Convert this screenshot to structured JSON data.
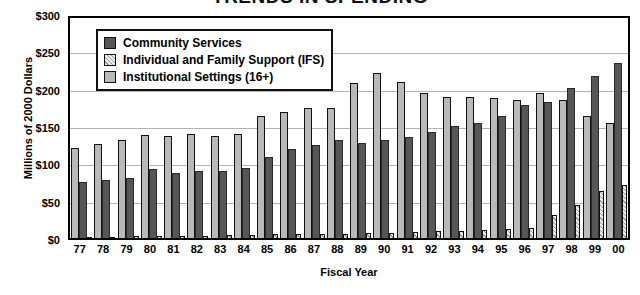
{
  "chart_data": {
    "type": "bar",
    "title": "TRENDS IN SPENDING",
    "xlabel": "Fiscal Year",
    "ylabel": "Millions of 2000 Dollars",
    "ylim": [
      0,
      300
    ],
    "ytick_labels": [
      "$300",
      "$250",
      "$200",
      "$150",
      "$100",
      "$50",
      "$0"
    ],
    "ytick_values": [
      300,
      250,
      200,
      150,
      100,
      50,
      0
    ],
    "grid": true,
    "legend_position": "upper-left-inside",
    "categories": [
      "77",
      "78",
      "79",
      "80",
      "81",
      "82",
      "83",
      "84",
      "85",
      "86",
      "87",
      "88",
      "89",
      "90",
      "91",
      "92",
      "93",
      "94",
      "95",
      "96",
      "97",
      "98",
      "99",
      "00"
    ],
    "series": [
      {
        "name": "Community Services",
        "color": "#565656",
        "values": [
          76,
          79,
          81,
          93,
          88,
          90,
          90,
          95,
          110,
          120,
          126,
          132,
          128,
          133,
          137,
          143,
          151,
          155,
          165,
          180,
          184,
          203,
          219,
          237
        ]
      },
      {
        "name": "Individual and Family Support (IFS)",
        "color": "#ececec",
        "values": [
          2,
          2,
          3,
          3,
          3,
          3,
          4,
          4,
          5,
          5,
          6,
          6,
          7,
          7,
          8,
          9,
          10,
          11,
          12,
          14,
          31,
          44,
          64,
          72
        ]
      },
      {
        "name": "Institutional Settings (16+)",
        "color": "#b9b9b9",
        "values": [
          122,
          127,
          133,
          139,
          138,
          140,
          138,
          140,
          165,
          170,
          176,
          176,
          209,
          223,
          211,
          196,
          190,
          190,
          189,
          186,
          196,
          186,
          165,
          155
        ]
      }
    ]
  },
  "legend": {
    "items": [
      {
        "label": "Community Services",
        "swatch": "comm"
      },
      {
        "label": "Individual and Family Support (IFS)",
        "swatch": "ifs"
      },
      {
        "label": "Institutional Settings (16+)",
        "swatch": "inst"
      }
    ]
  }
}
